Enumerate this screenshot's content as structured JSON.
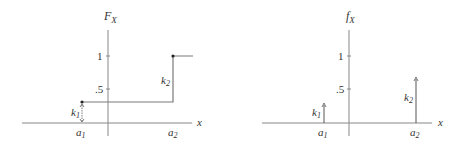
{
  "diagrams": [
    {
      "name": "cdf",
      "y_label": "F",
      "y_label_sub": "X",
      "x_label": "x",
      "ticks": [
        {
          "label": "1",
          "value": 1
        },
        {
          "label": ".5",
          "value": 0.5
        }
      ],
      "points": [
        {
          "label": "a",
          "label_sub": "1",
          "jump_label": "k",
          "jump_sub": "1",
          "jump": 0.3
        },
        {
          "label": "a",
          "label_sub": "2",
          "jump_label": "k",
          "jump_sub": "2",
          "jump": 0.7
        }
      ]
    },
    {
      "name": "pmf",
      "y_label": "f",
      "y_label_sub": "X",
      "x_label": "x",
      "ticks": [
        {
          "label": "1",
          "value": 1
        },
        {
          "label": ".5",
          "value": 0.5
        }
      ],
      "points": [
        {
          "label": "a",
          "label_sub": "1",
          "jump_label": "k",
          "jump_sub": "1",
          "jump": 0.3
        },
        {
          "label": "a",
          "label_sub": "2",
          "jump_label": "k",
          "jump_sub": "2",
          "jump": 0.7
        }
      ]
    }
  ],
  "colors": {
    "axis": "#888888",
    "line": "#7a7a7a",
    "text": "#333333"
  }
}
